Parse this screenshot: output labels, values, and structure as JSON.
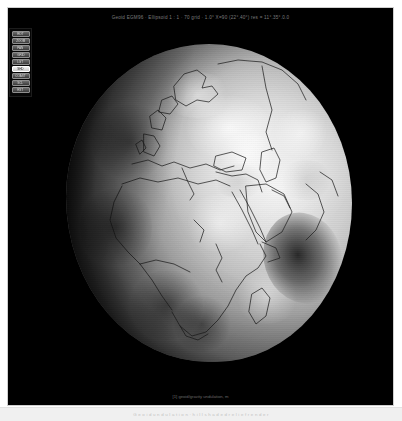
{
  "window": {
    "background_color": "#ffffff",
    "canvas_color": "#000000",
    "frame_border_color": "#cfcfcf"
  },
  "render_title": "Geoid EGM96 · Ellipsoid 1 : 1 · 70 grid · 1.0° X=90 (22°.40°) res = 11°.35°.0.0",
  "toolbar": {
    "name": "view-toolbar",
    "buttons": [
      {
        "id": "rotate",
        "label": "ROT",
        "active": false
      },
      {
        "id": "zoom",
        "label": "ZOOM",
        "active": false
      },
      {
        "id": "pan",
        "label": "PAN",
        "active": false
      },
      {
        "id": "grid",
        "label": "GRID",
        "active": false
      },
      {
        "id": "light",
        "label": "LGT",
        "active": false
      },
      {
        "id": "shade",
        "label": "SHD",
        "active": true
      },
      {
        "id": "coast",
        "label": "COAST",
        "active": false
      },
      {
        "id": "scale",
        "label": "SCL",
        "active": false
      },
      {
        "id": "reset",
        "label": "RST",
        "active": false
      }
    ]
  },
  "globe": {
    "name": "geoid-globe",
    "model": "EGM96",
    "center_lon": "22°E",
    "center_lat": "18°N",
    "shading": "hillshade",
    "coastlines_on": true,
    "features": [
      "Europe",
      "Scandinavia",
      "Mediterranean Sea",
      "Black Sea",
      "Caspian Sea",
      "Arabian Peninsula",
      "Red Sea",
      "Africa",
      "Madagascar",
      "Indian Ocean geoid low",
      "India"
    ]
  },
  "canvas_caption": "[1] geoid/gravity undulation, m",
  "status_text": "G e o i d   u n d u l a t i o n   ·   h i l l s h a d e d   r e l i e f   r e n d e r"
}
